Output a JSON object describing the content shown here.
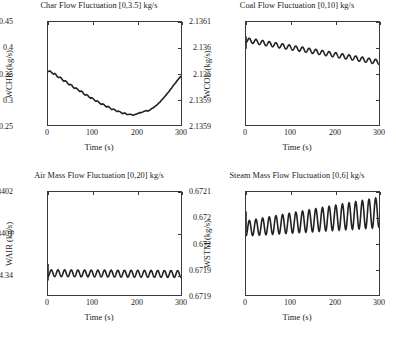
{
  "figure": {
    "xlabel": "Time (s)",
    "xticks": [
      "0",
      "100",
      "200",
      "300"
    ],
    "subplots": [
      {
        "id": "char-flow",
        "title": "Char Flow Fluctuation [0,3.5] kg/s",
        "ylabel": "WCHR (kg/s)",
        "yticks": [
          "0.25",
          "0.3",
          "0.35",
          "0.4",
          "0.45"
        ]
      },
      {
        "id": "coal-flow",
        "title": "Coal Flow Fluctuation [0,10] kg/s",
        "ylabel": "WCOL (kg/s)",
        "yticks": [
          "2.1359",
          "2.1359",
          "2.136",
          "2.136",
          "2.1361"
        ]
      },
      {
        "id": "air-mass-flow",
        "title": "Air Mass Flow Fluctuation [0,20] kg/s",
        "ylabel": "WAIR (kg/s)",
        "yticks": [
          "4.34",
          "4.3401",
          "4.3402"
        ]
      },
      {
        "id": "steam-mass-flow",
        "title": "Steam Mass Flow Fluctuation [0,6] kg/s",
        "ylabel": "WSTM (kg/s)",
        "yticks": [
          "0.6719",
          "0.6719",
          "0.672",
          "0.672",
          "0.6721"
        ]
      }
    ]
  },
  "chart_data": [
    {
      "type": "line",
      "id": "char-flow",
      "title": "Char Flow Fluctuation [0,3.5] kg/s",
      "xlabel": "Time (s)",
      "ylabel": "WCHR (kg/s)",
      "xlim": [
        0,
        300
      ],
      "ylim": [
        0.25,
        0.45
      ],
      "xticks": [
        0,
        100,
        200,
        300
      ],
      "yticks": [
        0.25,
        0.3,
        0.35,
        0.4,
        0.45
      ],
      "grid": false,
      "legend": null,
      "line_color": "#222222",
      "series": [
        {
          "name": "WCHR",
          "x": [
            0,
            5,
            10,
            15,
            20,
            25,
            30,
            35,
            40,
            45,
            50,
            55,
            60,
            65,
            70,
            75,
            80,
            85,
            90,
            95,
            100,
            105,
            110,
            115,
            120,
            125,
            130,
            135,
            140,
            145,
            150,
            155,
            160,
            165,
            170,
            175,
            180,
            185,
            190,
            195,
            200,
            205,
            210,
            215,
            220,
            225,
            230,
            235,
            240,
            245,
            250,
            255,
            260,
            265,
            270,
            275,
            280,
            285,
            290,
            295,
            300
          ],
          "y": [
            0.353,
            0.355,
            0.352,
            0.348,
            0.345,
            0.341,
            0.338,
            0.336,
            0.333,
            0.329,
            0.327,
            0.325,
            0.322,
            0.318,
            0.316,
            0.315,
            0.312,
            0.308,
            0.307,
            0.306,
            0.303,
            0.299,
            0.298,
            0.298,
            0.296,
            0.292,
            0.291,
            0.291,
            0.289,
            0.285,
            0.283,
            0.283,
            0.281,
            0.277,
            0.274,
            0.274,
            0.273,
            0.27,
            0.268,
            0.268,
            0.267,
            0.264,
            0.262,
            0.263,
            0.264,
            0.262,
            0.261,
            0.263,
            0.265,
            0.265,
            0.264,
            0.267,
            0.271,
            0.273,
            0.274,
            0.278,
            0.285,
            0.291,
            0.296,
            0.303,
            0.31
          ]
        }
      ]
    },
    {
      "type": "line",
      "id": "coal-flow",
      "title": "Coal Flow Fluctuation [0,10] kg/s",
      "xlabel": "Time (s)",
      "ylabel": "WCOL (kg/s)",
      "xlim": [
        0,
        300
      ],
      "ylim": [
        2.13585,
        2.13605
      ],
      "xticks": [
        0,
        100,
        200,
        300
      ],
      "ytick_values": [
        2.13585,
        2.1359,
        2.13595,
        2.136,
        2.13605
      ],
      "ytick_labels": [
        "2.1359",
        "2.1359",
        "2.136",
        "2.136",
        "2.1361"
      ],
      "grid": false,
      "legend": null,
      "line_color": "#222222",
      "description": "Oscillation of about 20 cycles with slowly decaying mean from 2.13601 to 2.13597",
      "series": [
        {
          "name": "WCOL",
          "mean_start": 2.136015,
          "mean_end": 2.135972,
          "amplitude": 4.5e-06,
          "cycles": 20
        }
      ]
    },
    {
      "type": "line",
      "id": "air-mass-flow",
      "title": "Air Mass Flow Fluctuation [0,20] kg/s",
      "xlabel": "Time (s)",
      "ylabel": "WAIR (kg/s)",
      "xlim": [
        0,
        300
      ],
      "ylim": [
        4.33995,
        4.34021
      ],
      "xticks": [
        0,
        100,
        200,
        300
      ],
      "ytick_values": [
        4.34,
        4.3401,
        4.3402
      ],
      "ytick_labels": [
        "4.34",
        "4.3401",
        "4.3402"
      ],
      "grid": false,
      "legend": null,
      "line_color": "#222222",
      "description": "Steady oscillation around 4.34 with nearly constant small amplitude, about 20 cycles",
      "series": [
        {
          "name": "WAIR",
          "mean_start": 4.340005,
          "mean_end": 4.340003,
          "amplitude": 8.5e-06,
          "cycles": 20
        }
      ]
    },
    {
      "type": "line",
      "id": "steam-mass-flow",
      "title": "Steam Mass Flow Fluctuation [0,6] kg/s",
      "xlabel": "Time (s)",
      "ylabel": "WSTM (kg/s)",
      "xlim": [
        0,
        300
      ],
      "ylim": [
        0.67188,
        0.67212
      ],
      "xticks": [
        0,
        100,
        200,
        300
      ],
      "ytick_values": [
        0.67188,
        0.67194,
        0.672,
        0.67206,
        0.67212
      ],
      "ytick_labels": [
        "0.6719",
        "0.6719",
        "0.672",
        "0.672",
        "0.6721"
      ],
      "grid": false,
      "legend": null,
      "line_color": "#222222",
      "description": "Oscillation with growing amplitude and slowly rising mean, about 20 cycles",
      "series": [
        {
          "name": "WSTM",
          "mean_start": 0.672035,
          "mean_end": 0.672072,
          "amplitude_start": 1.75e-05,
          "amplitude_end": 3.5e-05,
          "cycles": 20
        }
      ]
    }
  ]
}
